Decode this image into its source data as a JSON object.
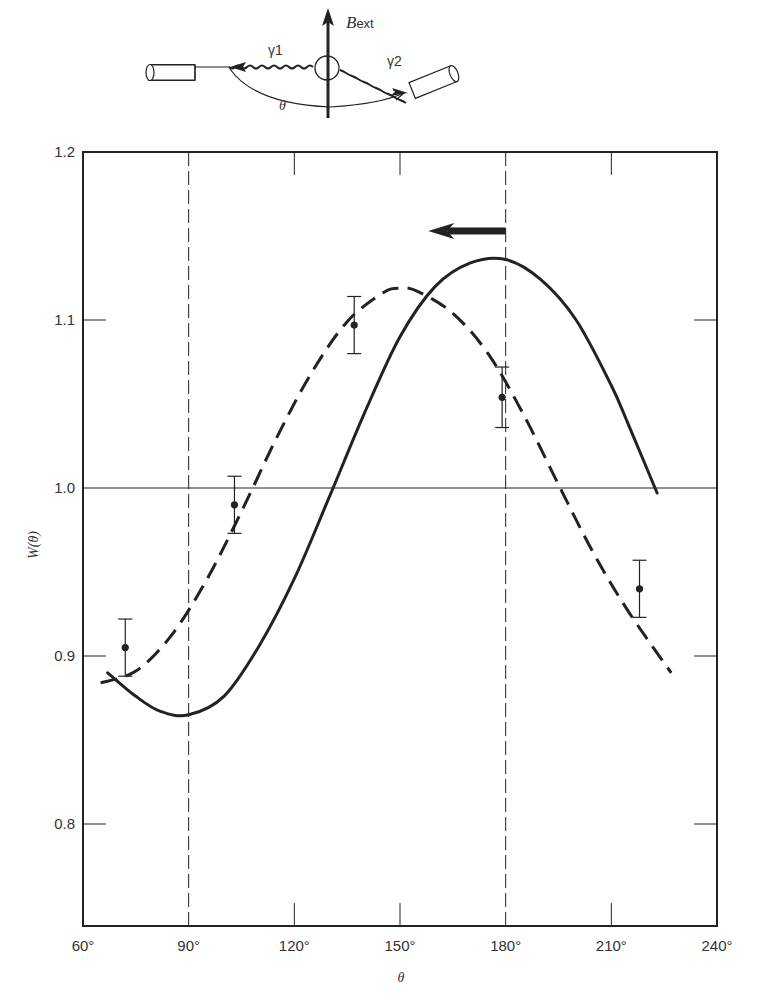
{
  "diagram": {
    "field_label_main": "B",
    "field_label_sub": "ext",
    "gamma1_label": "γ1",
    "gamma2_label": "γ2",
    "angle_label": "θ"
  },
  "axes": {
    "ylabel": "W(θ)",
    "xlabel": "θ",
    "xticks": [
      "60°",
      "90°",
      "120°",
      "150°",
      "180°",
      "210°",
      "240°"
    ],
    "yticks": [
      "1.2",
      "1.1",
      "1.0",
      "0.9",
      "0.8"
    ]
  },
  "colors": {
    "ink": "#222222",
    "background": "#ffffff"
  },
  "chart_data": {
    "type": "line",
    "title": "",
    "xlabel": "θ",
    "ylabel": "W(θ)",
    "xlim": [
      60,
      240
    ],
    "ylim": [
      0.74,
      1.2
    ],
    "grid": false,
    "reference_lines": {
      "horizontal": [
        1.0
      ],
      "vertical_dashed": [
        90,
        180
      ]
    },
    "annotation": {
      "type": "arrow",
      "direction": "left",
      "from_x": 180,
      "to_x": 160,
      "y": 1.153,
      "meaning": "shift of the angular correlation pattern due to external field"
    },
    "series": [
      {
        "name": "unperturbed (solid)",
        "style": "solid",
        "x": [
          67,
          75,
          82,
          90,
          100,
          110,
          120,
          130,
          140,
          150,
          160,
          170,
          180,
          190,
          200,
          210,
          215,
          223
        ],
        "y": [
          0.89,
          0.876,
          0.867,
          0.865,
          0.876,
          0.906,
          0.946,
          0.995,
          1.045,
          1.09,
          1.12,
          1.134,
          1.136,
          1.124,
          1.1,
          1.061,
          1.037,
          0.997
        ]
      },
      {
        "name": "rotated by field (dashed)",
        "style": "dashed",
        "x": [
          65,
          75,
          85,
          95,
          105,
          115,
          125,
          135,
          145,
          150,
          155,
          165,
          175,
          185,
          195,
          205,
          215,
          227
        ],
        "y": [
          0.884,
          0.891,
          0.912,
          0.945,
          0.986,
          1.03,
          1.069,
          1.099,
          1.116,
          1.119,
          1.117,
          1.104,
          1.08,
          1.044,
          1.002,
          0.961,
          0.926,
          0.89
        ]
      },
      {
        "name": "measured",
        "style": "points-with-errorbars",
        "x": [
          72,
          103,
          137,
          179,
          218
        ],
        "y": [
          0.905,
          0.99,
          1.097,
          1.054,
          0.94
        ],
        "yerr": [
          0.017,
          0.017,
          0.017,
          0.018,
          0.017
        ]
      }
    ]
  }
}
